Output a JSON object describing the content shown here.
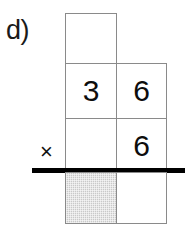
{
  "worksheet": {
    "problem_label": "d)",
    "operator_symbol": "×",
    "colors": {
      "cell_border": "#8a8a8a",
      "shaded_cell_fill": "#c9c9c9",
      "rule_line": "#000000",
      "digit_text": "#0d0d0d",
      "page_background": "#ffffff"
    },
    "grid": {
      "columns": [
        "tens",
        "ones"
      ],
      "rows": [
        {
          "name": "multiplicand-upper",
          "cells": [
            {
              "column": "tens",
              "value": "",
              "present": true,
              "shaded": false
            },
            {
              "column": "ones",
              "value": "",
              "present": false,
              "shaded": false
            }
          ]
        },
        {
          "name": "multiplicand",
          "cells": [
            {
              "column": "tens",
              "value": "3",
              "present": true,
              "shaded": false
            },
            {
              "column": "ones",
              "value": "6",
              "present": true,
              "shaded": false
            }
          ]
        },
        {
          "name": "multiplier",
          "cells": [
            {
              "column": "tens",
              "value": "",
              "present": true,
              "shaded": false
            },
            {
              "column": "ones",
              "value": "6",
              "present": true,
              "shaded": false
            }
          ]
        },
        {
          "name": "product",
          "cells": [
            {
              "column": "tens",
              "value": "",
              "present": true,
              "shaded": true
            },
            {
              "column": "ones",
              "value": "",
              "present": true,
              "shaded": false
            }
          ]
        }
      ]
    }
  }
}
